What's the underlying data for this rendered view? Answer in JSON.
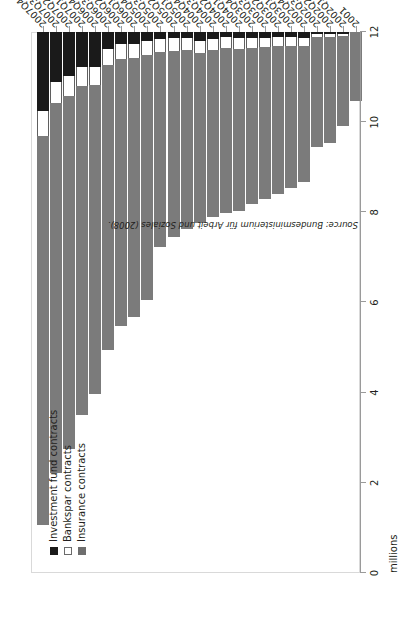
{
  "chart_data": {
    "type": "bar",
    "orientation": "horizontal",
    "stacked": true,
    "title": "",
    "subtitle": "",
    "xlabel": "",
    "ylabel": "millions",
    "axis_unit_label": "millions",
    "ylim": [
      0,
      12
    ],
    "grid": false,
    "legend_position": "top-left",
    "tick_labels": [
      "0",
      "2",
      "4",
      "6",
      "8",
      "10",
      "12"
    ],
    "tick_values": [
      0,
      2,
      4,
      6,
      8,
      10,
      12
    ],
    "categories": [
      "2007Q4",
      "2007Q3",
      "2007Q2",
      "2007Q1",
      "2006Q4",
      "2006Q3",
      "2006Q2",
      "2006Q1",
      "2005Q4",
      "2005Q3",
      "2005Q2",
      "2005Q1",
      "2004Q4",
      "2004Q3",
      "2004Q2",
      "2004Q1",
      "2003Q4",
      "2003Q3",
      "2003Q2",
      "2003Q1",
      "2002Q4",
      "2002Q3",
      "2002Q2",
      "2002Q1",
      "2001"
    ],
    "series": [
      {
        "name": "Insurance contracts",
        "color": "#7b7b7b",
        "values": [
          8.63,
          8.2,
          7.84,
          7.3,
          6.85,
          6.32,
          5.93,
          5.74,
          5.42,
          4.32,
          4.12,
          3.96,
          3.77,
          3.7,
          3.66,
          3.61,
          3.46,
          3.37,
          3.28,
          3.16,
          3.01,
          2.44,
          2.36,
          2.0,
          1.54
        ]
      },
      {
        "name": "Bankspar contracts",
        "color": "#ffffff",
        "values": [
          0.55,
          0.46,
          0.44,
          0.42,
          0.4,
          0.36,
          0.33,
          0.32,
          0.31,
          0.29,
          0.28,
          0.27,
          0.26,
          0.25,
          0.24,
          0.23,
          0.22,
          0.21,
          0.2,
          0.19,
          0.17,
          0.06,
          0.05,
          0.04,
          0.0
        ]
      },
      {
        "name": "Investment fund contracts",
        "color": "#1a1a1a",
        "values": [
          1.76,
          1.12,
          0.98,
          0.78,
          0.77,
          0.37,
          0.26,
          0.26,
          0.21,
          0.15,
          0.14,
          0.14,
          0.21,
          0.15,
          0.11,
          0.14,
          0.13,
          0.13,
          0.12,
          0.12,
          0.14,
          0.05,
          0.05,
          0.05,
          0.0
        ]
      }
    ]
  },
  "legend": {
    "items": [
      {
        "label": "Investment fund contracts",
        "swatch": "fund"
      },
      {
        "label": "Bankspar contracts",
        "swatch": "bankspar"
      },
      {
        "label": "Insurance contracts",
        "swatch": "insurance"
      }
    ]
  },
  "source_note": "Source: Bundesministerium für Arbeit und Soziales (2008).",
  "colors": {
    "insurance": "#7b7b7b",
    "bankspar": "#ffffff",
    "fund": "#1a1a1a",
    "axis": "#9a9a9a",
    "frame": "#d9d9d9",
    "text": "#231f20"
  }
}
